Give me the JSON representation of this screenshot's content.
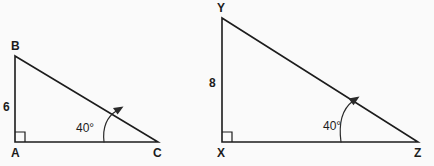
{
  "canvas": {
    "width": 434,
    "height": 166,
    "background_color": "#fafafa",
    "stroke_color": "#1c1c1c"
  },
  "chart_data": {
    "type": "diagram",
    "title": "",
    "subtitle": "",
    "figures": [
      {
        "id": "triangle-abc",
        "name": "Triangle ABC",
        "vertices": [
          {
            "label": "B",
            "x": 15,
            "y": 56,
            "label_x": 11,
            "label_y": 40,
            "position": "top-left"
          },
          {
            "label": "A",
            "x": 15,
            "y": 142,
            "label_x": 11,
            "label_y": 147,
            "position": "bottom-left"
          },
          {
            "label": "C",
            "x": 158,
            "y": 142,
            "label_x": 153,
            "label_y": 147,
            "position": "bottom-right"
          }
        ],
        "side_labels": [
          {
            "text": "6",
            "side": "AB",
            "x": 3,
            "y": 100,
            "description": "vertical leg length"
          }
        ],
        "angle_marks": [
          {
            "text": "40°",
            "at_vertex": "C",
            "value": 40,
            "unit": "degrees",
            "label_x": 76,
            "label_y": 121
          }
        ],
        "right_angle_at": "A"
      },
      {
        "id": "triangle-xyz",
        "name": "Triangle XYZ",
        "vertices": [
          {
            "label": "Y",
            "x": 222,
            "y": 18,
            "label_x": 217,
            "label_y": 2,
            "position": "top-left"
          },
          {
            "label": "X",
            "x": 222,
            "y": 142,
            "label_x": 217,
            "label_y": 147,
            "position": "bottom-left"
          },
          {
            "label": "Z",
            "x": 418,
            "y": 142,
            "label_x": 414,
            "label_y": 147,
            "position": "bottom-right"
          }
        ],
        "side_labels": [
          {
            "text": "8",
            "side": "XY",
            "x": 209,
            "y": 76,
            "description": "vertical leg length"
          }
        ],
        "angle_marks": [
          {
            "text": "40°",
            "at_vertex": "Z",
            "value": 40,
            "unit": "degrees",
            "label_x": 323,
            "label_y": 119
          }
        ],
        "right_angle_at": "X"
      }
    ]
  },
  "left_triangle": {
    "vertex_b": "B",
    "vertex_a": "A",
    "vertex_c": "C",
    "leg_length": "6",
    "angle": "40°"
  },
  "right_triangle": {
    "vertex_y": "Y",
    "vertex_x": "X",
    "vertex_z": "Z",
    "leg_length": "8",
    "angle": "40°"
  }
}
